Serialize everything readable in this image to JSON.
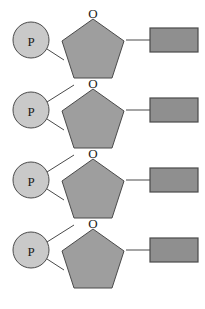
{
  "diagram": {
    "canvas": {
      "width": 205,
      "height": 309,
      "background": "#ffffff"
    },
    "colors": {
      "phosphate_fill": "#c9c9c9",
      "sugar_fill": "#9e9e9e",
      "base_fill": "#8f8f8f",
      "stroke": "#4a4a4a",
      "label": "#1a1a1a"
    },
    "labels": {
      "phosphate": "P",
      "oxygen": "O"
    },
    "units": [
      {
        "index": 1,
        "phosphate": {
          "label": "P",
          "cx": 31,
          "cy": 40,
          "r": 18
        },
        "sugar": {
          "label": "O",
          "cx": 93,
          "cy": 48,
          "r": 31
        },
        "base": {
          "x": 150,
          "y": 28,
          "width": 48,
          "height": 24
        }
      },
      {
        "index": 2,
        "phosphate": {
          "label": "P",
          "cx": 31,
          "cy": 110,
          "r": 18
        },
        "sugar": {
          "label": "O",
          "cx": 93,
          "cy": 118,
          "r": 31
        },
        "base": {
          "x": 150,
          "y": 98,
          "width": 48,
          "height": 24
        }
      },
      {
        "index": 3,
        "phosphate": {
          "label": "P",
          "cx": 31,
          "cy": 180,
          "r": 18
        },
        "sugar": {
          "label": "O",
          "cx": 93,
          "cy": 188,
          "r": 31
        },
        "base": {
          "x": 150,
          "y": 168,
          "width": 48,
          "height": 24
        }
      },
      {
        "index": 4,
        "phosphate": {
          "label": "P",
          "cx": 31,
          "cy": 250,
          "r": 18
        },
        "sugar": {
          "label": "O",
          "cx": 93,
          "cy": 258,
          "r": 31
        },
        "base": {
          "x": 150,
          "y": 238,
          "width": 48,
          "height": 24
        }
      }
    ],
    "icon_names": [
      "phosphate-circle-icon",
      "sugar-pentagon-icon",
      "nitrogenous-base-rect-icon"
    ]
  }
}
